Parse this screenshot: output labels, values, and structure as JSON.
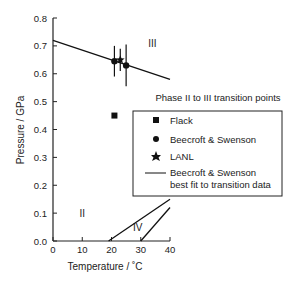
{
  "chart_data": {
    "type": "scatter",
    "title": "",
    "xlabel": "Temperature / ˚C",
    "ylabel": "Pressure / GPa",
    "xlim": [
      0,
      40
    ],
    "ylim": [
      0.0,
      0.8
    ],
    "x_ticks": [
      "0",
      "10",
      "20",
      "30",
      "40"
    ],
    "y_ticks": [
      "0.0",
      "0.1",
      "0.2",
      "0.3",
      "0.4",
      "0.5",
      "0.6",
      "0.7",
      "0.8"
    ],
    "grid": false,
    "regions": [
      {
        "label": "III",
        "x": 34,
        "y": 0.71
      },
      {
        "label": "II",
        "x": 10,
        "y": 0.1
      },
      {
        "label": "IV",
        "x": 29,
        "y": 0.05
      }
    ],
    "series": [
      {
        "name": "Flack",
        "marker": "square",
        "points": [
          {
            "x": 21,
            "y": 0.45
          }
        ]
      },
      {
        "name": "Beecroft & Swenson",
        "marker": "circle",
        "points": [
          {
            "x": 21,
            "y": 0.645,
            "err": 0.055
          },
          {
            "x": 25,
            "y": 0.63,
            "err": 0.075
          }
        ]
      },
      {
        "name": "LANL",
        "marker": "star",
        "points": [
          {
            "x": 23,
            "y": 0.65,
            "err": 0.04
          }
        ]
      },
      {
        "name": "Beecroft & Swenson best fit to transition data",
        "type": "line",
        "points": [
          {
            "x": 0,
            "y": 0.72
          },
          {
            "x": 40,
            "y": 0.58
          }
        ]
      },
      {
        "name": "II-IV boundary",
        "type": "line",
        "points": [
          {
            "x": 19,
            "y": 0.0
          },
          {
            "x": 40,
            "y": 0.15
          }
        ]
      },
      {
        "name": "III-IV boundary",
        "type": "line",
        "points": [
          {
            "x": 30,
            "y": 0.0
          },
          {
            "x": 40,
            "y": 0.12
          }
        ]
      }
    ],
    "legend": {
      "title": "Phase II to III transition points",
      "entries": [
        "Flack",
        "Beecroft & Swenson",
        "LANL",
        "Beecroft & Swenson",
        "best fit to transition data"
      ],
      "position": "right"
    }
  }
}
